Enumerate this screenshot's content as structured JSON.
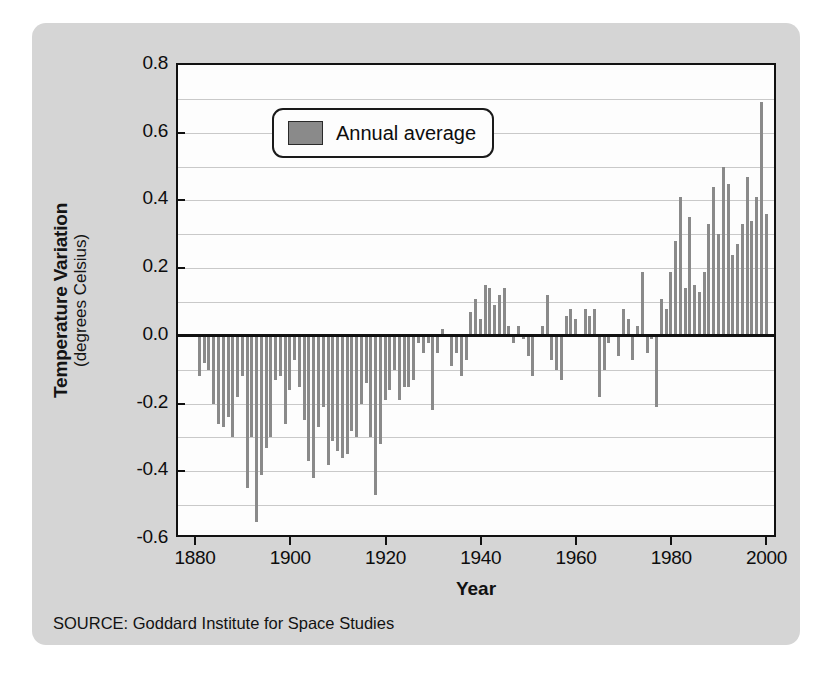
{
  "figure": {
    "card_color": "#d5d5d5",
    "plot_background": "#fdfdfd",
    "source_note": "SOURCE: Goddard Institute for Space Studies"
  },
  "legend": {
    "label": "Annual average",
    "swatch_color": "#8a8a8a"
  },
  "axis": {
    "y_title_line1": "Temperature Variation",
    "y_title_line2": "(degrees Celsius)",
    "x_title": "Year",
    "y_ticks": [
      "0.8",
      "0.6",
      "0.4",
      "0.2",
      "0.0",
      "-0.2",
      "-0.4",
      "-0.6"
    ],
    "x_ticks": [
      "1880",
      "1900",
      "1920",
      "1940",
      "1960",
      "1980",
      "2000"
    ]
  },
  "chart_data": {
    "type": "bar",
    "title": "",
    "subtitle": "",
    "xlabel": "Year",
    "ylabel": "Temperature Variation (degrees Celsius)",
    "legend": [
      "Annual average"
    ],
    "legend_position": "top-center-inside",
    "grid": true,
    "grid_interval": 0.1,
    "bar_color": "#8a8a8a",
    "xlim": [
      1876,
      2002
    ],
    "ylim": [
      -0.6,
      0.8
    ],
    "ytick_interval": 0.2,
    "xtick_interval": 20,
    "zero_line": true,
    "categories": [
      1880,
      1881,
      1882,
      1883,
      1884,
      1885,
      1886,
      1887,
      1888,
      1889,
      1890,
      1891,
      1892,
      1893,
      1894,
      1895,
      1896,
      1897,
      1898,
      1899,
      1900,
      1901,
      1902,
      1903,
      1904,
      1905,
      1906,
      1907,
      1908,
      1909,
      1910,
      1911,
      1912,
      1913,
      1914,
      1915,
      1916,
      1917,
      1918,
      1919,
      1920,
      1921,
      1922,
      1923,
      1924,
      1925,
      1926,
      1927,
      1928,
      1929,
      1930,
      1931,
      1932,
      1933,
      1934,
      1935,
      1936,
      1937,
      1938,
      1939,
      1940,
      1941,
      1942,
      1943,
      1944,
      1945,
      1946,
      1947,
      1948,
      1949,
      1950,
      1951,
      1952,
      1953,
      1954,
      1955,
      1956,
      1957,
      1958,
      1959,
      1960,
      1961,
      1962,
      1963,
      1964,
      1965,
      1966,
      1967,
      1968,
      1969,
      1970,
      1971,
      1972,
      1973,
      1974,
      1975,
      1976,
      1977,
      1978,
      1979,
      1980,
      1981,
      1982,
      1983,
      1984,
      1985,
      1986,
      1987,
      1988,
      1989,
      1990,
      1991,
      1992,
      1993,
      1994,
      1995,
      1996,
      1997,
      1998,
      1999
    ],
    "values": [
      -0.12,
      -0.08,
      -0.1,
      -0.2,
      -0.26,
      -0.27,
      -0.24,
      -0.3,
      -0.18,
      -0.12,
      -0.45,
      -0.3,
      -0.55,
      -0.41,
      -0.33,
      -0.3,
      -0.13,
      -0.12,
      -0.26,
      -0.16,
      -0.07,
      -0.15,
      -0.25,
      -0.37,
      -0.42,
      -0.27,
      -0.21,
      -0.38,
      -0.31,
      -0.34,
      -0.36,
      -0.35,
      -0.28,
      -0.3,
      -0.2,
      -0.14,
      -0.3,
      -0.47,
      -0.32,
      -0.19,
      -0.16,
      -0.1,
      -0.19,
      -0.15,
      -0.15,
      -0.13,
      -0.02,
      -0.05,
      -0.02,
      -0.22,
      -0.05,
      0.02,
      0.0,
      -0.09,
      -0.05,
      -0.12,
      -0.07,
      0.07,
      0.11,
      0.05,
      0.15,
      0.14,
      0.09,
      0.12,
      0.14,
      0.03,
      -0.02,
      0.03,
      -0.01,
      -0.06,
      -0.12,
      0.0,
      0.03,
      0.12,
      -0.07,
      -0.1,
      -0.13,
      0.06,
      0.08,
      0.05,
      0.0,
      0.08,
      0.06,
      0.08,
      -0.18,
      -0.1,
      -0.02,
      0.0,
      -0.06,
      0.08,
      0.05,
      -0.07,
      0.03,
      0.19,
      -0.05,
      -0.01,
      -0.21,
      0.11,
      0.08,
      0.19,
      0.28,
      0.41,
      0.14,
      0.35,
      0.15,
      0.13,
      0.19,
      0.33,
      0.44,
      0.3,
      0.5,
      0.45,
      0.24,
      0.27,
      0.33,
      0.47,
      0.34,
      0.41,
      0.69,
      0.36
    ]
  }
}
